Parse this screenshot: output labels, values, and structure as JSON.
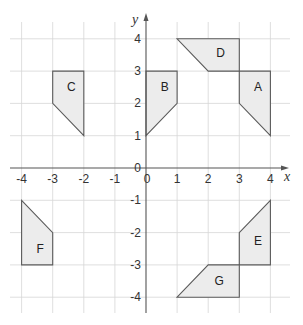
{
  "diagram": {
    "type": "coordinate-grid",
    "axes": {
      "x_label": "x",
      "y_label": "y",
      "x_range": [
        -4,
        4
      ],
      "y_range": [
        -4,
        4
      ],
      "x_ticks": [
        "-4",
        "-3",
        "-2",
        "-1",
        "0",
        "1",
        "2",
        "3",
        "4"
      ],
      "y_ticks": [
        "4",
        "3",
        "2",
        "1",
        "0",
        "-1",
        "-2",
        "-3",
        "-4"
      ]
    },
    "shapes": [
      {
        "label": "A",
        "vertices": [
          [
            3,
            3
          ],
          [
            4,
            3
          ],
          [
            4,
            1
          ],
          [
            3,
            2
          ]
        ]
      },
      {
        "label": "B",
        "vertices": [
          [
            0,
            3
          ],
          [
            1,
            3
          ],
          [
            1,
            2
          ],
          [
            0,
            1
          ]
        ]
      },
      {
        "label": "C",
        "vertices": [
          [
            -3,
            3
          ],
          [
            -2,
            3
          ],
          [
            -2,
            1
          ],
          [
            -3,
            2
          ]
        ]
      },
      {
        "label": "D",
        "vertices": [
          [
            1,
            4
          ],
          [
            3,
            4
          ],
          [
            3,
            3
          ],
          [
            2,
            3
          ]
        ]
      },
      {
        "label": "E",
        "vertices": [
          [
            3,
            -2
          ],
          [
            4,
            -1
          ],
          [
            4,
            -3
          ],
          [
            3,
            -3
          ]
        ]
      },
      {
        "label": "F",
        "vertices": [
          [
            -4,
            -1
          ],
          [
            -3,
            -2
          ],
          [
            -3,
            -3
          ],
          [
            -4,
            -3
          ]
        ]
      },
      {
        "label": "G",
        "vertices": [
          [
            1,
            -4
          ],
          [
            2,
            -3
          ],
          [
            3,
            -3
          ],
          [
            3,
            -4
          ]
        ]
      }
    ],
    "colors": {
      "shape_fill": "#ececec",
      "shape_stroke": "#5a5a5a",
      "grid": "#d6d6d6",
      "axis": "#555555"
    }
  }
}
